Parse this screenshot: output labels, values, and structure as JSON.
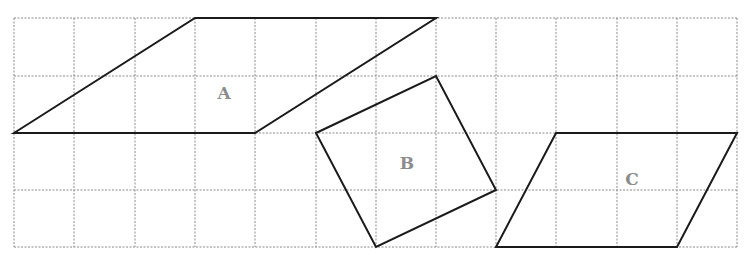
{
  "diagram": {
    "type": "grid-shapes",
    "grid": {
      "columns": 12,
      "rows": 4,
      "x_lines": [
        14,
        74,
        135,
        195,
        255,
        316,
        376,
        436,
        496,
        556,
        617,
        677,
        737
      ],
      "y_lines": [
        18,
        76,
        133,
        190,
        247
      ],
      "line_color": "#8a8a8a",
      "style": "dotted"
    },
    "shapes": [
      {
        "id": "A",
        "label": "A",
        "kind": "parallelogram",
        "grid_vertices": [
          [
            0,
            2
          ],
          [
            3,
            0
          ],
          [
            7,
            0
          ],
          [
            4,
            2
          ]
        ],
        "label_pos": [
          224,
          93
        ]
      },
      {
        "id": "B",
        "label": "B",
        "kind": "tilted square",
        "grid_vertices": [
          [
            5,
            2
          ],
          [
            7,
            1
          ],
          [
            8,
            3
          ],
          [
            6,
            4
          ]
        ],
        "label_pos": [
          407,
          163
        ]
      },
      {
        "id": "C",
        "label": "C",
        "kind": "parallelogram",
        "grid_vertices": [
          [
            9,
            2
          ],
          [
            12,
            2
          ],
          [
            11,
            4
          ],
          [
            8,
            4
          ]
        ],
        "label_pos": [
          632,
          179
        ]
      }
    ],
    "stroke_color": "#1a1a1a",
    "label_color": "#8c8c8c"
  }
}
